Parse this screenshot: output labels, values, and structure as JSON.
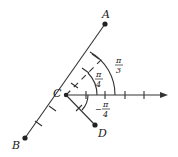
{
  "diagram": {
    "type": "polar-vectors",
    "points": {
      "A": {
        "label": "A"
      },
      "B": {
        "label": "B"
      },
      "C": {
        "label": "C"
      },
      "D": {
        "label": "D"
      }
    },
    "angles": [
      {
        "num": "π",
        "den": "3",
        "sign": ""
      },
      {
        "num": "π",
        "den": "4",
        "sign": ""
      },
      {
        "num": "π",
        "den": "4",
        "sign": "−"
      }
    ],
    "colors": {
      "line": "#333333",
      "ink": "#1a1a1a"
    }
  }
}
